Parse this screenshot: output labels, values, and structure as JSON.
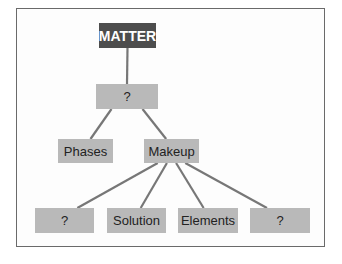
{
  "diagram": {
    "colors": {
      "root_fill": "#4d4d4d",
      "node_fill": "#b9b9b9",
      "link": "#777777",
      "frame": "#6a6a6a"
    },
    "nodes": [
      {
        "id": "matter",
        "label": "MATTER"
      },
      {
        "id": "q1",
        "label": "?"
      },
      {
        "id": "phases",
        "label": "Phases"
      },
      {
        "id": "makeup",
        "label": "Makeup"
      },
      {
        "id": "q2",
        "label": "?"
      },
      {
        "id": "solution",
        "label": "Solution"
      },
      {
        "id": "elements",
        "label": "Elements"
      },
      {
        "id": "q3",
        "label": "?"
      }
    ],
    "edges": [
      [
        "matter",
        "q1"
      ],
      [
        "q1",
        "phases"
      ],
      [
        "q1",
        "makeup"
      ],
      [
        "makeup",
        "q2"
      ],
      [
        "makeup",
        "solution"
      ],
      [
        "makeup",
        "elements"
      ],
      [
        "makeup",
        "q3"
      ]
    ]
  }
}
